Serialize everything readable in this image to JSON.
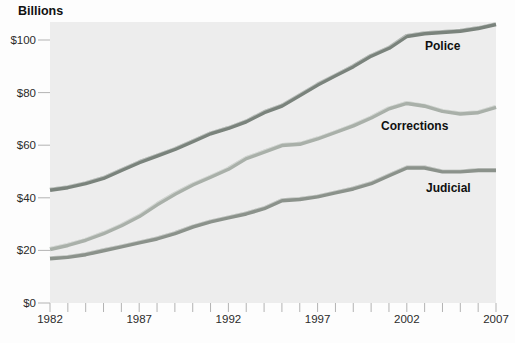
{
  "title": "Billions",
  "chart_data": {
    "type": "line",
    "title": "Billions",
    "xlabel": "",
    "ylabel": "Billions of dollars",
    "x": [
      1982,
      1983,
      1984,
      1985,
      1986,
      1987,
      1988,
      1989,
      1990,
      1991,
      1992,
      1993,
      1994,
      1995,
      1996,
      1997,
      1998,
      1999,
      2000,
      2001,
      2002,
      2003,
      2004,
      2005,
      2006,
      2007
    ],
    "xlim": [
      1982,
      2007
    ],
    "ylim": [
      0,
      110
    ],
    "x_tick_labels": [
      "1982",
      "1987",
      "1992",
      "1997",
      "2002",
      "2007"
    ],
    "x_tick_years_labeled": [
      1982,
      1987,
      1992,
      1997,
      2002,
      2007
    ],
    "x_minor_tick_every": 1,
    "y_ticks": [
      0,
      20,
      40,
      60,
      80,
      100
    ],
    "y_tick_labels": [
      "$0",
      "$20",
      "$40",
      "$60",
      "$80",
      "$100"
    ],
    "grid": false,
    "legend": "direct-labels-on-chart",
    "plot_background": "#ededed",
    "tick_color": "#b3b3b3",
    "series": [
      {
        "name": "Police",
        "color": "#7a837c",
        "values": [
          43,
          44,
          45.5,
          47.5,
          50.5,
          53.5,
          56,
          58.5,
          61.5,
          64.5,
          66.5,
          69,
          72.5,
          75,
          79,
          83,
          86.5,
          90,
          94,
          97,
          101.5,
          102.5,
          103,
          103.5,
          104.5,
          106
        ]
      },
      {
        "name": "Corrections",
        "color": "#a9b0a9",
        "values": [
          20.5,
          22,
          24,
          26.5,
          29.5,
          33,
          37.5,
          41.5,
          45,
          48,
          51,
          55,
          57.5,
          60,
          60.5,
          62.5,
          65,
          67.5,
          70.5,
          74,
          76,
          75,
          73,
          72,
          72.5,
          74.5
        ]
      },
      {
        "name": "Judicial",
        "color": "#8b928b",
        "values": [
          17,
          17.5,
          18.5,
          20,
          21.5,
          23,
          24.5,
          26.5,
          29,
          31,
          32.5,
          34,
          36,
          39,
          39.5,
          40.5,
          42,
          43.5,
          45.5,
          48.5,
          51.5,
          51.5,
          50,
          50,
          50.5,
          50.5
        ]
      }
    ]
  }
}
